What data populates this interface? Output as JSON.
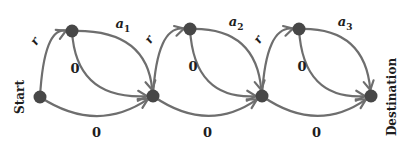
{
  "diagram": {
    "type": "state-graph",
    "colors": {
      "edge": "#6e6e6e",
      "node": "#474747",
      "text": "#1e1e1e"
    },
    "start_label": "Start",
    "destination_label": "Destination",
    "nodes": [
      {
        "id": "n0",
        "role": "start"
      },
      {
        "id": "u1",
        "role": "intermediate"
      },
      {
        "id": "n1",
        "role": "junction"
      },
      {
        "id": "u2",
        "role": "intermediate"
      },
      {
        "id": "n2",
        "role": "junction"
      },
      {
        "id": "u3",
        "role": "intermediate"
      },
      {
        "id": "n3",
        "role": "destination"
      }
    ],
    "edges": [
      {
        "from": "n0",
        "to": "u1",
        "label": "r"
      },
      {
        "from": "u1",
        "to": "n1",
        "label": "a",
        "sub": "1",
        "route": "outer"
      },
      {
        "from": "u1",
        "to": "n1",
        "label": "0",
        "route": "inner"
      },
      {
        "from": "n0",
        "to": "n1",
        "label": "0",
        "route": "bottom"
      },
      {
        "from": "n1",
        "to": "u2",
        "label": "r"
      },
      {
        "from": "u2",
        "to": "n2",
        "label": "a",
        "sub": "2",
        "route": "outer"
      },
      {
        "from": "u2",
        "to": "n2",
        "label": "0",
        "route": "inner"
      },
      {
        "from": "n1",
        "to": "n2",
        "label": "0",
        "route": "bottom"
      },
      {
        "from": "n2",
        "to": "u3",
        "label": "r"
      },
      {
        "from": "u3",
        "to": "n3",
        "label": "a",
        "sub": "3",
        "route": "outer"
      },
      {
        "from": "u3",
        "to": "n3",
        "label": "0",
        "route": "inner"
      },
      {
        "from": "n2",
        "to": "n3",
        "label": "0",
        "route": "bottom"
      }
    ]
  }
}
